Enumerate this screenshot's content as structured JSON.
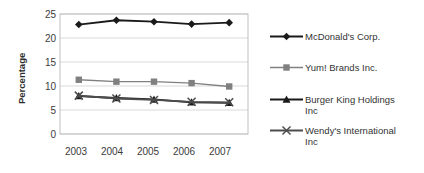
{
  "chart_data": {
    "type": "line",
    "title": "",
    "subtitle": "",
    "xlabel": "",
    "ylabel": "Percentage",
    "categories": [
      "2003",
      "2004",
      "2005",
      "2006",
      "2007"
    ],
    "x": [
      2003,
      2004,
      2005,
      2006,
      2007
    ],
    "ylim": [
      0,
      25
    ],
    "yticks": [
      0,
      5,
      10,
      15,
      20,
      25
    ],
    "ytick_labels": [
      "0",
      "5",
      "10",
      "15",
      "20",
      "25"
    ],
    "grid": true,
    "grid_axis": "y",
    "legend_position": "right",
    "series": [
      {
        "name": "McDonald's Corp.",
        "marker": "diamond",
        "color": "#1a1a1a",
        "values": [
          22.8,
          23.7,
          23.4,
          22.9,
          23.2
        ]
      },
      {
        "name": "Yum! Brands Inc.",
        "marker": "square",
        "color": "#808080",
        "values": [
          11.3,
          10.9,
          10.9,
          10.6,
          9.9
        ]
      },
      {
        "name": "Burger King Holdings Inc",
        "marker": "triangle",
        "color": "#1a1a1a",
        "values": [
          7.9,
          7.5,
          7.2,
          6.6,
          6.5
        ]
      },
      {
        "name": "Wendy's International Inc",
        "marker": "x",
        "color": "#4d4d4d",
        "values": [
          8.0,
          7.4,
          7.1,
          6.7,
          6.6
        ]
      }
    ]
  },
  "axis": {
    "ytick_0": "0",
    "ytick_1": "5",
    "ytick_2": "10",
    "ytick_3": "15",
    "ytick_4": "20",
    "ytick_5": "25",
    "xtick_0": "2003",
    "xtick_1": "2004",
    "xtick_2": "2005",
    "xtick_3": "2006",
    "xtick_4": "2007",
    "ylabel": "Percentage"
  },
  "legend": {
    "entries": [
      {
        "label_line1": "McDonald's Corp.",
        "label_line2": ""
      },
      {
        "label_line1": "Yum! Brands Inc.",
        "label_line2": ""
      },
      {
        "label_line1": "Burger King Holdings",
        "label_line2": "Inc"
      },
      {
        "label_line1": "Wendy's International",
        "label_line2": "Inc"
      }
    ]
  },
  "colors": {
    "series_dark": "#1a1a1a",
    "series_gray": "#808080",
    "series_midgray": "#4d4d4d",
    "gridline": "#d9d9d9",
    "plot_border": "#bfbfbf",
    "text": "#333333",
    "background": "#ffffff"
  }
}
